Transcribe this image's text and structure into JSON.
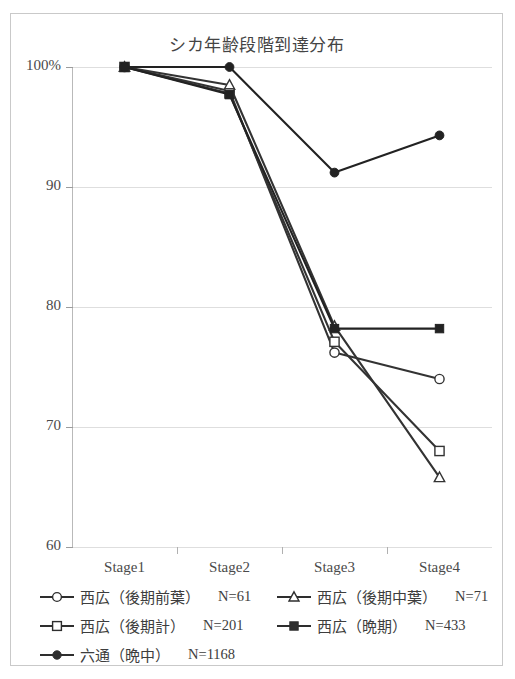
{
  "chart_data": {
    "type": "line",
    "title": "シカ年齢段階到達分布",
    "xlabel": "",
    "ylabel": "",
    "categories": [
      "Stage1",
      "Stage2",
      "Stage3",
      "Stage4"
    ],
    "ylim": [
      60,
      100
    ],
    "ytick_labels": [
      "100%",
      "90",
      "80",
      "70",
      "60"
    ],
    "ytick_values": [
      100,
      90,
      80,
      70,
      60
    ],
    "grid": true,
    "legend_position": "bottom",
    "series": [
      {
        "name": "西広（後期前葉）",
        "n_label": "N=61",
        "marker": "open-circle",
        "color": "#333333",
        "values": [
          100,
          98.0,
          76.2,
          74.0
        ]
      },
      {
        "name": "西広（後期中葉）",
        "n_label": "N=71",
        "marker": "open-triangle",
        "color": "#333333",
        "values": [
          100,
          98.5,
          78.4,
          65.8
        ]
      },
      {
        "name": "西広（後期計）",
        "n_label": "N=201",
        "marker": "open-square",
        "color": "#333333",
        "values": [
          100,
          97.8,
          77.1,
          68.0
        ]
      },
      {
        "name": "西広（晩期）",
        "n_label": "N=433",
        "marker": "filled-square",
        "color": "#222222",
        "values": [
          100,
          97.7,
          78.2,
          78.2
        ]
      },
      {
        "name": "六通（晩中）",
        "n_label": "N=1168",
        "marker": "filled-diamond",
        "color": "#222222",
        "values": [
          100,
          100,
          91.2,
          94.3
        ]
      }
    ]
  },
  "axis": {
    "y": {
      "labels": [
        "100%",
        "90",
        "80",
        "70",
        "60"
      ]
    },
    "x": {
      "labels": [
        "Stage1",
        "Stage2",
        "Stage3",
        "Stage4"
      ]
    }
  },
  "legend": {
    "rows": [
      [
        {
          "label": "西広（後期前葉）",
          "n": "N=61",
          "marker": "open-circle"
        },
        {
          "label": "西広（後期中葉）",
          "n": "N=71",
          "marker": "open-triangle"
        }
      ],
      [
        {
          "label": "西広（後期計）",
          "n": "N=201",
          "marker": "open-square"
        },
        {
          "label": "西広（晩期）",
          "n": "N=433",
          "marker": "filled-square"
        }
      ],
      [
        {
          "label": "六通（晩中）",
          "n": "N=1168",
          "marker": "filled-diamond"
        }
      ]
    ]
  }
}
